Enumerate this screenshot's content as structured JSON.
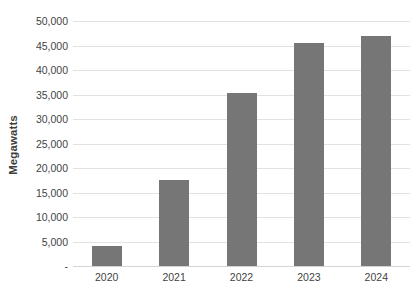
{
  "chart_data": {
    "type": "bar",
    "title": "",
    "subtitle": "",
    "xlabel": "",
    "ylabel": "Megawatts",
    "categories": [
      "2020",
      "2021",
      "2022",
      "2023",
      "2024"
    ],
    "values": [
      4000,
      17500,
      35400,
      45500,
      46900
    ],
    "series": [
      {
        "name": "Megawatts",
        "values": [
          4000,
          17500,
          35400,
          45500,
          46900
        ]
      }
    ],
    "ylim": [
      0,
      50000
    ],
    "ytick_values": [
      0,
      5000,
      10000,
      15000,
      20000,
      25000,
      30000,
      35000,
      40000,
      45000,
      50000
    ],
    "ytick_labels": [
      "-",
      "5,000",
      "10,000",
      "15,000",
      "20,000",
      "25,000",
      "30,000",
      "35,000",
      "40,000",
      "45,000",
      "50,000"
    ],
    "grid": true,
    "grid_axis": "y",
    "legend": false,
    "legend_position": "none",
    "bar_color": "#767676",
    "gridline_color": "#e2e2e2",
    "axis_line_color": "#d4d4d4",
    "text_color": "#3f3f3f",
    "background_color": "#ffffff"
  }
}
